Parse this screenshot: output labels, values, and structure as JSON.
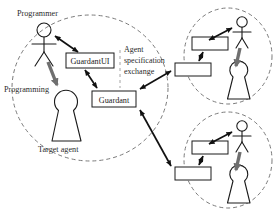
{
  "diagram": {
    "labels": {
      "programmer": "Programmer",
      "programming": "Programming",
      "target_agent": "Target agent",
      "annotation_line1": "Agent",
      "annotation_line2": "specification",
      "annotation_line3": "exchange"
    },
    "boxes": {
      "guardant_ui": "GuardantUI",
      "guardant": "Guardant",
      "remote_top_upper": "",
      "remote_top_lower": "",
      "remote_bottom_upper": "",
      "remote_bottom_lower": ""
    },
    "groups": [
      {
        "name": "left-site",
        "label": "Target agent"
      },
      {
        "name": "right-top-site",
        "label": ""
      },
      {
        "name": "right-bottom-site",
        "label": ""
      }
    ],
    "colors": {
      "stroke": "#1a1a1a",
      "group_boundary": "#7a7a7a",
      "thin_arrow": "#111111",
      "thick_arrow": "#6f6f6f",
      "background": "#ffffff"
    },
    "icons": {
      "programmer": "stick-figure-icon",
      "agent": "keyhole-agent-icon",
      "bidirectional": "double-arrow-icon",
      "directed": "arrow-icon"
    }
  }
}
